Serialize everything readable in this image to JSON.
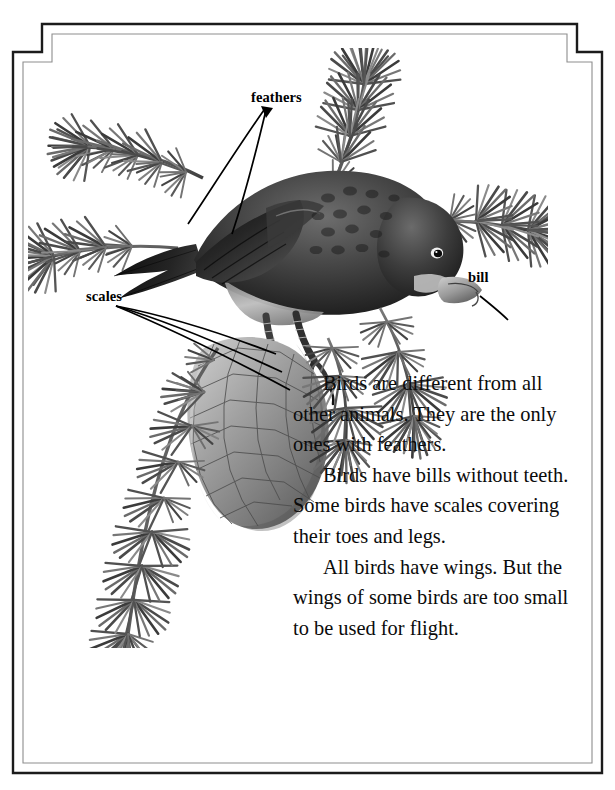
{
  "page": {
    "kind": "illustrated-textbook-page",
    "background_color": "#ffffff",
    "ink_color": "#000000"
  },
  "frame": {
    "outer_color": "#1a1a1a",
    "inner_color": "#8d8d8d",
    "style": "double-rule-with-notched-top-corners"
  },
  "illustration": {
    "subject": "bird perched on a spruce branch with a pine cone",
    "bird": "finch-like bird with dark plumage, hooked bill, feeding on cone",
    "palette": {
      "darkest": "#141414",
      "dark": "#3a3a3a",
      "mid": "#6f6f6f",
      "light": "#a9a9a9",
      "lightest": "#d8d8d8",
      "paper": "#ffffff"
    }
  },
  "labels": [
    {
      "id": "feathers",
      "text": "feathers"
    },
    {
      "id": "scales",
      "text": "scales"
    },
    {
      "id": "bill",
      "text": "bill"
    }
  ],
  "body": {
    "paragraphs": [
      "Birds are different from all other animals. They are the only ones with feathers.",
      "Birds have bills without teeth. Some birds have scales covering their toes and legs.",
      "All birds have wings. But the wings of some birds are too small to be used for flight."
    ]
  }
}
